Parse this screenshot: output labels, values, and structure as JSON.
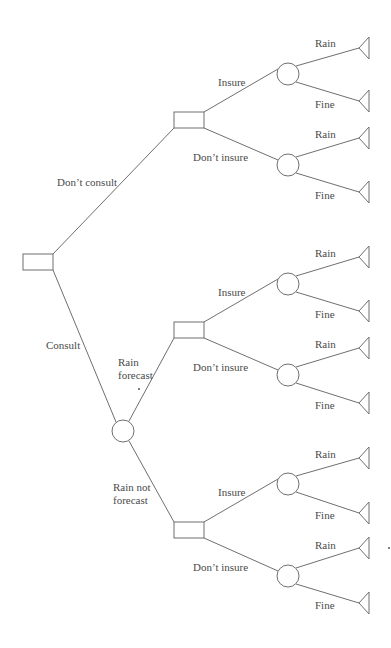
{
  "diagram": {
    "type": "decision-tree",
    "colors": {
      "stroke": "#6f6f6f",
      "text": "#4a4a4a",
      "background": "#ffffff"
    },
    "decision_nodes": [
      {
        "id": "root",
        "x": 23,
        "y": 254,
        "w": 30,
        "h": 16
      },
      {
        "id": "d_noconsult",
        "x": 174,
        "y": 112,
        "w": 30,
        "h": 16
      },
      {
        "id": "d_rainforecast",
        "x": 174,
        "y": 322,
        "w": 30,
        "h": 16
      },
      {
        "id": "d_norainforecast",
        "x": 174,
        "y": 522,
        "w": 30,
        "h": 16
      }
    ],
    "chance_nodes": [
      {
        "id": "c_forecast",
        "cx": 123,
        "cy": 431,
        "r": 11
      },
      {
        "id": "c1",
        "cx": 288,
        "cy": 74,
        "r": 11
      },
      {
        "id": "c2",
        "cx": 288,
        "cy": 165,
        "r": 11
      },
      {
        "id": "c3",
        "cx": 288,
        "cy": 284,
        "r": 11
      },
      {
        "id": "c4",
        "cx": 288,
        "cy": 375,
        "r": 11
      },
      {
        "id": "c5",
        "cx": 288,
        "cy": 484,
        "r": 11
      },
      {
        "id": "c6",
        "cx": 288,
        "cy": 576,
        "r": 11
      }
    ],
    "terminal_nodes": [
      {
        "apex_x": 359,
        "apex_y": 48
      },
      {
        "apex_x": 359,
        "apex_y": 101
      },
      {
        "apex_x": 359,
        "apex_y": 138
      },
      {
        "apex_x": 359,
        "apex_y": 192
      },
      {
        "apex_x": 359,
        "apex_y": 257
      },
      {
        "apex_x": 359,
        "apex_y": 311
      },
      {
        "apex_x": 359,
        "apex_y": 348
      },
      {
        "apex_x": 359,
        "apex_y": 403
      },
      {
        "apex_x": 359,
        "apex_y": 458
      },
      {
        "apex_x": 359,
        "apex_y": 513
      },
      {
        "apex_x": 359,
        "apex_y": 548
      },
      {
        "apex_x": 359,
        "apex_y": 603
      }
    ],
    "edges": [
      {
        "x1": 53,
        "y1": 254,
        "x2": 174,
        "y2": 128
      },
      {
        "x1": 53,
        "y1": 270,
        "x2": 116,
        "y2": 422
      },
      {
        "x1": 204,
        "y1": 112,
        "x2": 278,
        "y2": 69
      },
      {
        "x1": 204,
        "y1": 128,
        "x2": 278,
        "y2": 160
      },
      {
        "x1": 129,
        "y1": 421,
        "x2": 174,
        "y2": 338
      },
      {
        "x1": 129,
        "y1": 441,
        "x2": 174,
        "y2": 522
      },
      {
        "x1": 204,
        "y1": 322,
        "x2": 278,
        "y2": 279
      },
      {
        "x1": 204,
        "y1": 338,
        "x2": 278,
        "y2": 370
      },
      {
        "x1": 204,
        "y1": 522,
        "x2": 278,
        "y2": 479
      },
      {
        "x1": 204,
        "y1": 538,
        "x2": 278,
        "y2": 571
      },
      {
        "x1": 296,
        "y1": 66,
        "x2": 359,
        "y2": 48
      },
      {
        "x1": 296,
        "y1": 82,
        "x2": 359,
        "y2": 101
      },
      {
        "x1": 296,
        "y1": 157,
        "x2": 359,
        "y2": 138
      },
      {
        "x1": 296,
        "y1": 173,
        "x2": 359,
        "y2": 192
      },
      {
        "x1": 296,
        "y1": 276,
        "x2": 359,
        "y2": 257
      },
      {
        "x1": 296,
        "y1": 292,
        "x2": 359,
        "y2": 311
      },
      {
        "x1": 296,
        "y1": 367,
        "x2": 359,
        "y2": 348
      },
      {
        "x1": 296,
        "y1": 383,
        "x2": 359,
        "y2": 403
      },
      {
        "x1": 296,
        "y1": 476,
        "x2": 359,
        "y2": 458
      },
      {
        "x1": 296,
        "y1": 492,
        "x2": 359,
        "y2": 513
      },
      {
        "x1": 296,
        "y1": 568,
        "x2": 359,
        "y2": 548
      },
      {
        "x1": 296,
        "y1": 584,
        "x2": 359,
        "y2": 603
      }
    ],
    "labels": {
      "dont_consult": "Don’t consult",
      "consult": "Consult",
      "rain_forecast_1": "Rain",
      "rain_forecast_2": "forecast",
      "rain_not_forecast_1": "Rain not",
      "rain_not_forecast_2": "forecast",
      "branches": [
        {
          "key": "insure_1",
          "text": "Insure",
          "x": 218,
          "y": 86
        },
        {
          "key": "dont_insure_1",
          "text": "Don’t insure",
          "x": 193,
          "y": 161
        },
        {
          "key": "insure_2",
          "text": "Insure",
          "x": 218,
          "y": 296
        },
        {
          "key": "dont_insure_2",
          "text": "Don’t insure",
          "x": 193,
          "y": 371
        },
        {
          "key": "insure_3",
          "text": "Insure",
          "x": 218,
          "y": 496
        },
        {
          "key": "dont_insure_3",
          "text": "Don’t insure",
          "x": 193,
          "y": 571
        }
      ],
      "outcomes": [
        {
          "text": "Rain",
          "x": 315,
          "y": 47
        },
        {
          "text": "Fine",
          "x": 315,
          "y": 108
        },
        {
          "text": "Rain",
          "x": 315,
          "y": 138
        },
        {
          "text": "Fine",
          "x": 315,
          "y": 199
        },
        {
          "text": "Rain",
          "x": 315,
          "y": 257
        },
        {
          "text": "Fine",
          "x": 315,
          "y": 318
        },
        {
          "text": "Rain",
          "x": 315,
          "y": 348
        },
        {
          "text": "Fine",
          "x": 315,
          "y": 409
        },
        {
          "text": "Rain",
          "x": 315,
          "y": 458
        },
        {
          "text": "Fine",
          "x": 315,
          "y": 519
        },
        {
          "text": "Rain",
          "x": 315,
          "y": 549
        },
        {
          "text": "Fine",
          "x": 315,
          "y": 609
        }
      ]
    }
  }
}
